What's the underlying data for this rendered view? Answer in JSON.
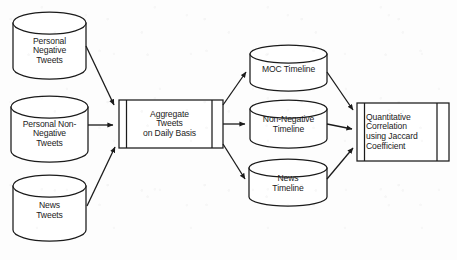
{
  "diagram": {
    "background_color": "#fdfdfd",
    "stroke_color": "#1b1b1b",
    "fill_color": "#ffffff",
    "text_color": "#1b1b1b"
  },
  "sources": [
    {
      "id": "personal-negative-tweets",
      "shape": "cylinder",
      "label": "Personal\nNegative\nTweets",
      "x": 13,
      "y": 12,
      "w": 73,
      "h": 67
    },
    {
      "id": "personal-non-negative-tweets",
      "shape": "cylinder",
      "label": "Personal Non-\nNegative\nTweets",
      "x": 11,
      "y": 96,
      "w": 77,
      "h": 66
    },
    {
      "id": "news-tweets",
      "shape": "cylinder",
      "label": "News\nTweets",
      "x": 13,
      "y": 175,
      "w": 73,
      "h": 66
    }
  ],
  "processes": [
    {
      "id": "aggregate-tweets",
      "shape": "predefined-process",
      "label": "Aggregate\nTweets\non Daily Basis",
      "x": 119,
      "y": 100,
      "w": 104,
      "h": 48
    },
    {
      "id": "quantitative-correlation",
      "shape": "predefined-process",
      "label": "Quantitative\nCorrelation\nusing Jaccard\nCoefficient",
      "x": 357,
      "y": 103,
      "w": 92,
      "h": 58
    }
  ],
  "timelines": [
    {
      "id": "moc-timeline",
      "shape": "cylinder",
      "label": "MOC Timeline",
      "x": 250,
      "y": 45,
      "w": 77,
      "h": 46
    },
    {
      "id": "non-negative-timeline",
      "shape": "cylinder",
      "label": "Non-Negative\nTimeline",
      "x": 250,
      "y": 100,
      "w": 77,
      "h": 48
    },
    {
      "id": "news-timeline",
      "shape": "cylinder",
      "label": "News\nTimeline",
      "x": 249,
      "y": 159,
      "w": 78,
      "h": 47
    }
  ],
  "connectors": [
    {
      "id": "personal-negative-to-aggregate",
      "from": "personal-negative-tweets",
      "to": "aggregate-tweets",
      "path": "M86,46 L115,106"
    },
    {
      "id": "personal-non-negative-to-aggregate",
      "from": "personal-non-negative-tweets",
      "to": "aggregate-tweets",
      "path": "M88,125 L115,125"
    },
    {
      "id": "news-tweets-to-aggregate",
      "from": "news-tweets",
      "to": "aggregate-tweets",
      "path": "M87,206 L116,146"
    },
    {
      "id": "aggregate-to-moc-timeline",
      "from": "aggregate-tweets",
      "to": "moc-timeline",
      "path": "M224,105 L247,71"
    },
    {
      "id": "aggregate-to-non-negative-timeline",
      "from": "aggregate-tweets",
      "to": "non-negative-timeline",
      "path": "M224,124 L247,124"
    },
    {
      "id": "aggregate-to-news-timeline",
      "from": "aggregate-tweets",
      "to": "news-timeline",
      "path": "M224,144 L247,180"
    },
    {
      "id": "moc-timeline-to-correlation",
      "from": "moc-timeline",
      "to": "quantitative-correlation",
      "path": "M327,71 L354,110"
    },
    {
      "id": "non-negative-timeline-to-correlation",
      "from": "non-negative-timeline",
      "to": "quantitative-correlation",
      "path": "M327,124 L354,129"
    },
    {
      "id": "news-timeline-to-correlation",
      "from": "news-timeline",
      "to": "quantitative-correlation",
      "path": "M327,180 L354,148"
    }
  ]
}
